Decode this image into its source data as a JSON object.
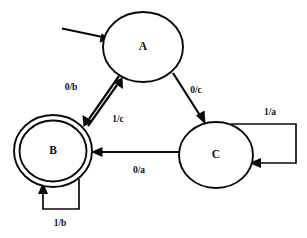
{
  "diagram": {
    "type": "finite-state-machine",
    "title": "",
    "background_color": "#ffffff",
    "stroke_color": "#0a0a0a",
    "states": [
      {
        "id": "A",
        "label": "A",
        "shape": "ellipse",
        "accepting": false,
        "initial": true,
        "cx": 143,
        "cy": 47,
        "rx": 40,
        "ry": 35
      },
      {
        "id": "B",
        "label": "B",
        "shape": "double-ellipse",
        "accepting": true,
        "initial": false,
        "cx": 53,
        "cy": 151,
        "rx": 39,
        "ry": 36
      },
      {
        "id": "C",
        "label": "C",
        "shape": "ellipse",
        "accepting": false,
        "initial": false,
        "cx": 216,
        "cy": 155,
        "rx": 37,
        "ry": 33
      }
    ],
    "transitions": [
      {
        "from": "A",
        "to": "B",
        "label": "0/b",
        "label_x": 71,
        "label_y": 88,
        "kind": "straight"
      },
      {
        "from": "B",
        "to": "A",
        "label": "1/c",
        "label_x": 118,
        "label_y": 120,
        "kind": "straight"
      },
      {
        "from": "A",
        "to": "C",
        "label": "0/c",
        "label_x": 196,
        "label_y": 91,
        "kind": "straight"
      },
      {
        "from": "C",
        "to": "B",
        "label": "0/a",
        "label_x": 139,
        "label_y": 171,
        "kind": "straight"
      },
      {
        "from": "C",
        "to": "C",
        "label": "1/a",
        "label_x": 270,
        "label_y": 114,
        "kind": "self-loop"
      },
      {
        "from": "B",
        "to": "B",
        "label": "1/b",
        "label_x": 60,
        "label_y": 224,
        "kind": "self-loop"
      }
    ],
    "initial_arrow": {
      "name": "start-arrow",
      "from_x": 62,
      "from_y": 29,
      "to_x": 110,
      "to_y": 39
    }
  }
}
